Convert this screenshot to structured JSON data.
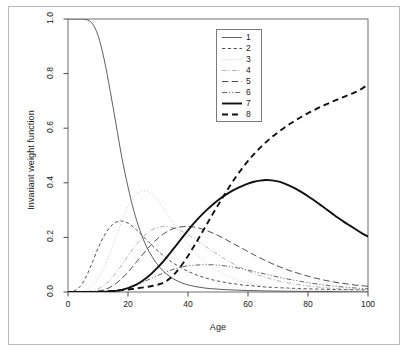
{
  "chart_data": {
    "type": "line",
    "title": "",
    "xlabel": "Age",
    "ylabel": "Invariant weight function",
    "xlim": [
      0,
      100
    ],
    "ylim": [
      0.0,
      1.0
    ],
    "grid": false,
    "legend_position": "top-center-right",
    "xticks": [
      "0",
      "20",
      "40",
      "60",
      "80",
      "100"
    ],
    "xtick_values": [
      0,
      20,
      40,
      60,
      80,
      100
    ],
    "yticks": [
      "0.0",
      "0.2",
      "0.4",
      "0.6",
      "0.8",
      "1.0"
    ],
    "ytick_values": [
      0.0,
      0.2,
      0.4,
      0.6,
      0.8,
      1.0
    ],
    "x": [
      0,
      2,
      4,
      6,
      8,
      10,
      12,
      14,
      16,
      18,
      20,
      22,
      24,
      26,
      28,
      30,
      32,
      34,
      36,
      38,
      40,
      42,
      44,
      46,
      48,
      50,
      52,
      54,
      56,
      58,
      60,
      62,
      64,
      66,
      68,
      70,
      72,
      74,
      76,
      78,
      80,
      82,
      84,
      86,
      88,
      90,
      92,
      94,
      96,
      98,
      100
    ],
    "series": [
      {
        "name": "1",
        "style": "solid-thin",
        "color": "#4d4d4d",
        "peak_value": 1.0,
        "peak_age": 0,
        "values": [
          1.0,
          1.0,
          1.0,
          0.998,
          0.985,
          0.94,
          0.855,
          0.74,
          0.615,
          0.49,
          0.385,
          0.295,
          0.225,
          0.17,
          0.13,
          0.098,
          0.074,
          0.056,
          0.043,
          0.033,
          0.026,
          0.021,
          0.017,
          0.014,
          0.012,
          0.0105,
          0.009,
          0.008,
          0.007,
          0.0062,
          0.0055,
          0.005,
          0.0045,
          0.004,
          0.0036,
          0.0033,
          0.003,
          0.0027,
          0.0025,
          0.0023,
          0.0021,
          0.0019,
          0.0018,
          0.0016,
          0.0015,
          0.0014,
          0.0013,
          0.0012,
          0.0011,
          0.001,
          0.001
        ]
      },
      {
        "name": "2",
        "style": "dashed-short",
        "color": "#3d3d3d",
        "peak_value": 0.26,
        "peak_age": 17,
        "values": [
          0.0,
          0.004,
          0.02,
          0.055,
          0.105,
          0.16,
          0.205,
          0.238,
          0.256,
          0.26,
          0.252,
          0.236,
          0.215,
          0.193,
          0.171,
          0.15,
          0.131,
          0.114,
          0.1,
          0.087,
          0.076,
          0.066,
          0.058,
          0.051,
          0.045,
          0.04,
          0.036,
          0.032,
          0.029,
          0.026,
          0.024,
          0.022,
          0.02,
          0.018,
          0.017,
          0.016,
          0.015,
          0.014,
          0.013,
          0.012,
          0.0115,
          0.011,
          0.0105,
          0.01,
          0.0095,
          0.009,
          0.0088,
          0.0085,
          0.0082,
          0.008,
          0.008
        ]
      },
      {
        "name": "3",
        "style": "dotted",
        "color": "#cccccc",
        "peak_value": 0.37,
        "peak_age": 24,
        "values": [
          0.0,
          0.0,
          0.002,
          0.008,
          0.022,
          0.048,
          0.088,
          0.142,
          0.202,
          0.262,
          0.312,
          0.348,
          0.368,
          0.37,
          0.358,
          0.335,
          0.305,
          0.272,
          0.238,
          0.206,
          0.176,
          0.15,
          0.127,
          0.107,
          0.09,
          0.076,
          0.064,
          0.054,
          0.046,
          0.039,
          0.033,
          0.028,
          0.024,
          0.021,
          0.018,
          0.0155,
          0.0135,
          0.0118,
          0.0103,
          0.009,
          0.008,
          0.007,
          0.0062,
          0.0055,
          0.0049,
          0.0044,
          0.004,
          0.0036,
          0.0033,
          0.003,
          0.003
        ]
      },
      {
        "name": "4",
        "style": "dashdot-fine",
        "color": "#a8a8a8",
        "peak_value": 0.24,
        "peak_age": 35,
        "values": [
          0.0,
          0.0,
          0.0,
          0.001,
          0.004,
          0.011,
          0.024,
          0.044,
          0.07,
          0.1,
          0.132,
          0.163,
          0.19,
          0.212,
          0.228,
          0.237,
          0.24,
          0.238,
          0.232,
          0.222,
          0.21,
          0.196,
          0.181,
          0.166,
          0.151,
          0.137,
          0.123,
          0.11,
          0.098,
          0.087,
          0.077,
          0.068,
          0.06,
          0.053,
          0.047,
          0.041,
          0.036,
          0.032,
          0.028,
          0.025,
          0.022,
          0.0195,
          0.0172,
          0.0152,
          0.0135,
          0.012,
          0.0107,
          0.0095,
          0.0085,
          0.0076,
          0.007
        ]
      },
      {
        "name": "5",
        "style": "dashed-long",
        "color": "#3d3d3d",
        "peak_value": 0.24,
        "peak_age": 41,
        "values": [
          0.0,
          0.0,
          0.0,
          0.0,
          0.001,
          0.003,
          0.008,
          0.017,
          0.031,
          0.05,
          0.073,
          0.099,
          0.126,
          0.152,
          0.176,
          0.197,
          0.214,
          0.227,
          0.235,
          0.239,
          0.24,
          0.238,
          0.233,
          0.226,
          0.217,
          0.207,
          0.196,
          0.184,
          0.172,
          0.16,
          0.148,
          0.136,
          0.125,
          0.114,
          0.104,
          0.095,
          0.086,
          0.078,
          0.071,
          0.064,
          0.058,
          0.052,
          0.047,
          0.042,
          0.038,
          0.034,
          0.031,
          0.028,
          0.025,
          0.023,
          0.021
        ]
      },
      {
        "name": "6",
        "style": "dashdotdot",
        "color": "#555555",
        "peak_value": 0.1,
        "peak_age": 48,
        "values": [
          0.0,
          0.0,
          0.0,
          0.0,
          0.0,
          0.0,
          0.001,
          0.002,
          0.005,
          0.009,
          0.015,
          0.022,
          0.031,
          0.041,
          0.051,
          0.061,
          0.07,
          0.079,
          0.086,
          0.092,
          0.096,
          0.098,
          0.0995,
          0.1,
          0.0998,
          0.0985,
          0.096,
          0.093,
          0.089,
          0.085,
          0.08,
          0.075,
          0.07,
          0.065,
          0.06,
          0.055,
          0.05,
          0.046,
          0.042,
          0.038,
          0.034,
          0.031,
          0.028,
          0.025,
          0.022,
          0.02,
          0.018,
          0.016,
          0.0145,
          0.013,
          0.012
        ]
      },
      {
        "name": "7",
        "style": "solid-thick",
        "color": "#111111",
        "peak_value": 0.41,
        "peak_age": 62,
        "values": [
          0.0,
          0.0,
          0.0,
          0.0,
          0.0,
          0.0,
          0.001,
          0.002,
          0.004,
          0.008,
          0.014,
          0.023,
          0.035,
          0.05,
          0.069,
          0.091,
          0.115,
          0.142,
          0.17,
          0.198,
          0.226,
          0.252,
          0.276,
          0.298,
          0.318,
          0.336,
          0.352,
          0.366,
          0.378,
          0.388,
          0.397,
          0.404,
          0.408,
          0.41,
          0.409,
          0.405,
          0.398,
          0.389,
          0.378,
          0.365,
          0.351,
          0.336,
          0.32,
          0.304,
          0.288,
          0.272,
          0.257,
          0.243,
          0.229,
          0.215,
          0.203
        ]
      },
      {
        "name": "8",
        "style": "dashed-thick",
        "color": "#111111",
        "peak_value": 0.76,
        "peak_age": 100,
        "values": [
          0.0,
          0.0,
          0.0,
          0.0,
          0.0,
          0.001,
          0.002,
          0.003,
          0.005,
          0.007,
          0.009,
          0.012,
          0.015,
          0.018,
          0.022,
          0.027,
          0.035,
          0.05,
          0.072,
          0.1,
          0.132,
          0.168,
          0.205,
          0.243,
          0.281,
          0.318,
          0.354,
          0.389,
          0.422,
          0.452,
          0.48,
          0.505,
          0.528,
          0.549,
          0.568,
          0.585,
          0.601,
          0.616,
          0.63,
          0.643,
          0.655,
          0.666,
          0.677,
          0.687,
          0.697,
          0.706,
          0.715,
          0.724,
          0.733,
          0.745,
          0.76
        ]
      }
    ]
  },
  "legend": {
    "entries": [
      {
        "label": "1"
      },
      {
        "label": "2"
      },
      {
        "label": "3"
      },
      {
        "label": "4"
      },
      {
        "label": "5"
      },
      {
        "label": "6"
      },
      {
        "label": "7"
      },
      {
        "label": "8"
      }
    ]
  }
}
